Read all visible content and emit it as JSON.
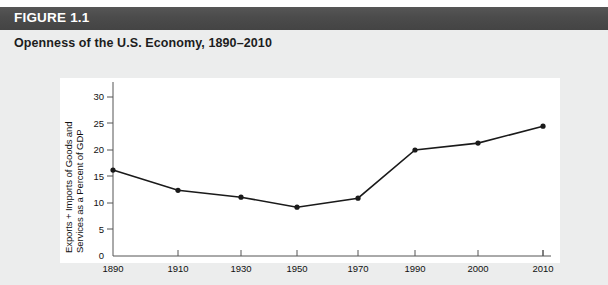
{
  "header": {
    "figure_label": "FIGURE 1.1",
    "bar_color": "#4a4a4a",
    "text_color": "#ffffff"
  },
  "subtitle": "Openness of the U.S. Economy, 1890–2010",
  "panel": {
    "background": "#ffffff",
    "page_background": "#eceded"
  },
  "chart_data": {
    "type": "line",
    "title": "Openness of the U.S. Economy, 1890–2010",
    "xlabel": "",
    "ylabel": "Exports + Imports of Goods and Services as a Percent of GDP",
    "ylabel_line1": "Exports + Imports of Goods and",
    "ylabel_line2": "Services as a Percent of GDP",
    "x": [
      1890,
      1910,
      1930,
      1950,
      1970,
      1990,
      2000,
      2010
    ],
    "categories": [
      "1890",
      "1910",
      "1930",
      "1950",
      "1970",
      "1990",
      "2000",
      "2010"
    ],
    "values": [
      16.2,
      12.4,
      11.1,
      9.2,
      10.9,
      20.0,
      21.3,
      24.5
    ],
    "series": [
      {
        "name": "Exports + Imports of Goods and Services as a Percent of GDP",
        "values": [
          16.2,
          12.4,
          11.1,
          9.2,
          10.9,
          20.0,
          21.3,
          24.5
        ]
      }
    ],
    "ylim": [
      0,
      30
    ],
    "yticks": [
      0,
      5,
      10,
      15,
      20,
      25,
      30
    ],
    "ytick_labels": [
      "0",
      "5",
      "10",
      "15",
      "20",
      "25",
      "30"
    ],
    "xtick_labels": [
      "1890",
      "1910",
      "1930",
      "1950",
      "1970",
      "1990",
      "2000",
      "2010"
    ],
    "xtick_positions_px": [
      113,
      178,
      241,
      297,
      358,
      415,
      478,
      543
    ],
    "grid": false,
    "legend": "none",
    "line_color": "#1a1a1a",
    "marker": "circle",
    "marker_color": "#1a1a1a"
  }
}
